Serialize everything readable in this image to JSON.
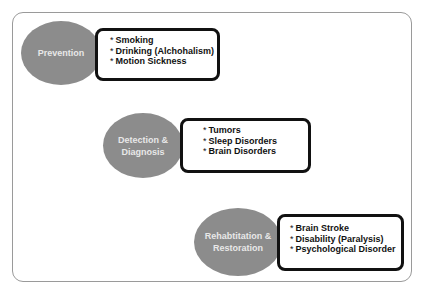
{
  "diagram": {
    "stages": [
      {
        "label": "Prevention",
        "items": [
          "Smoking",
          "Drinking (Alchohalism)",
          "Motion Sickness"
        ]
      },
      {
        "label": "Detection & Diagnosis",
        "items": [
          "Tumors",
          "Sleep Disorders",
          "Brain Disorders"
        ]
      },
      {
        "label": "Rehabtitation & Restoration",
        "items": [
          "Brain Stroke",
          "Disability (Paralysis)",
          "Psychological Disorder"
        ]
      }
    ],
    "bullet": "*",
    "colors": {
      "ellipse_fill": "#8c8c8c",
      "ellipse_text": "#e8e8e8",
      "box_border": "#111111",
      "frame_border": "#9a9a9a"
    }
  }
}
